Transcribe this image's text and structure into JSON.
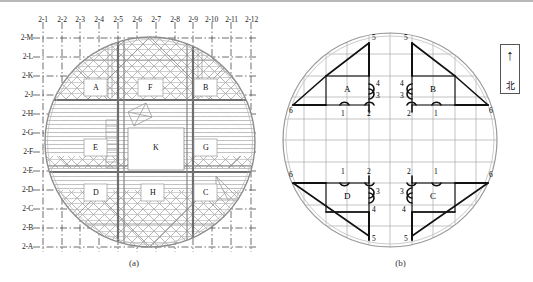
{
  "figure": {
    "panels": [
      {
        "id": "a",
        "caption": "(a)",
        "description": "structural-plan-with-grid-axes",
        "column_labels": [
          "2-1",
          "2-2",
          "2-3",
          "2-4",
          "2-5",
          "2-6",
          "2-7",
          "2-8",
          "2-9",
          "2-10",
          "2-11",
          "2-12"
        ],
        "row_labels": [
          "2-M",
          "2-L",
          "2-K",
          "2-J",
          "2-H",
          "2-G",
          "2-F",
          "2-E",
          "2-D",
          "2-C",
          "2-B",
          "2-A"
        ],
        "zones": [
          {
            "label": "A",
            "x": 95,
            "y": 88
          },
          {
            "label": "F",
            "x": 150,
            "y": 88
          },
          {
            "label": "B",
            "x": 205,
            "y": 88
          },
          {
            "label": "E",
            "x": 95,
            "y": 148
          },
          {
            "label": "K",
            "x": 155,
            "y": 148
          },
          {
            "label": "G",
            "x": 205,
            "y": 148
          },
          {
            "label": "D",
            "x": 95,
            "y": 193
          },
          {
            "label": "H",
            "x": 152,
            "y": 193
          },
          {
            "label": "C",
            "x": 205,
            "y": 193
          }
        ]
      },
      {
        "id": "b",
        "caption": "(b)",
        "description": "measurement-point-layout",
        "zones": [
          {
            "label": "A",
            "quadrant": "top-left",
            "points": [
              "1",
              "2",
              "3",
              "4",
              "5",
              "6"
            ]
          },
          {
            "label": "B",
            "quadrant": "top-right",
            "points": [
              "1",
              "2",
              "3",
              "4",
              "5",
              "6"
            ]
          },
          {
            "label": "C",
            "quadrant": "bottom-right",
            "points": [
              "1",
              "2",
              "3",
              "4",
              "5",
              "6"
            ]
          },
          {
            "label": "D",
            "quadrant": "bottom-left",
            "points": [
              "1",
              "2",
              "3",
              "4",
              "5",
              "6"
            ]
          }
        ],
        "north_indicator": {
          "arrow": "↑",
          "label": "北"
        }
      }
    ]
  },
  "colors": {
    "truss_grey": "#8d8d8d",
    "grid_grey": "#a9a9a9",
    "axis_dashdot": "#4a4a4a",
    "sensor_black": "#111111",
    "outline": "#9a9a9a"
  }
}
